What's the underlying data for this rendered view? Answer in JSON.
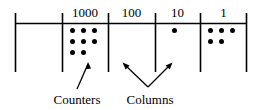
{
  "diagram": {
    "type": "place-value-counters-chart",
    "colors": {
      "ink": "#000000",
      "background": "#ffffff"
    },
    "geometry": {
      "width": 259,
      "height": 110,
      "header_rule_y": 23,
      "column_top_y": 13,
      "column_bottom_y": 72,
      "divider_x": [
        15,
        62,
        108,
        155,
        200,
        247
      ]
    },
    "columns": [
      {
        "id": "col-blank",
        "header": "",
        "counters": 0,
        "rows": []
      },
      {
        "id": "col-1000",
        "header": "1000",
        "counters": 8,
        "rows": [
          3,
          3,
          2
        ]
      },
      {
        "id": "col-100",
        "header": "100",
        "counters": 0,
        "rows": []
      },
      {
        "id": "col-10",
        "header": "10",
        "counters": 1,
        "rows": [
          1
        ]
      },
      {
        "id": "col-1",
        "header": "1",
        "counters": 5,
        "rows": [
          3,
          2
        ]
      }
    ],
    "annotations": [
      {
        "id": "counters-annotation",
        "label": "Counters",
        "arrow": "single-diagonal-up-right",
        "points_to": "counters in the 1000 column"
      },
      {
        "id": "columns-annotation",
        "label": "Columns",
        "arrow": "v-shaped-double-arrow",
        "points_to": "the vertical column divider lines"
      }
    ]
  }
}
